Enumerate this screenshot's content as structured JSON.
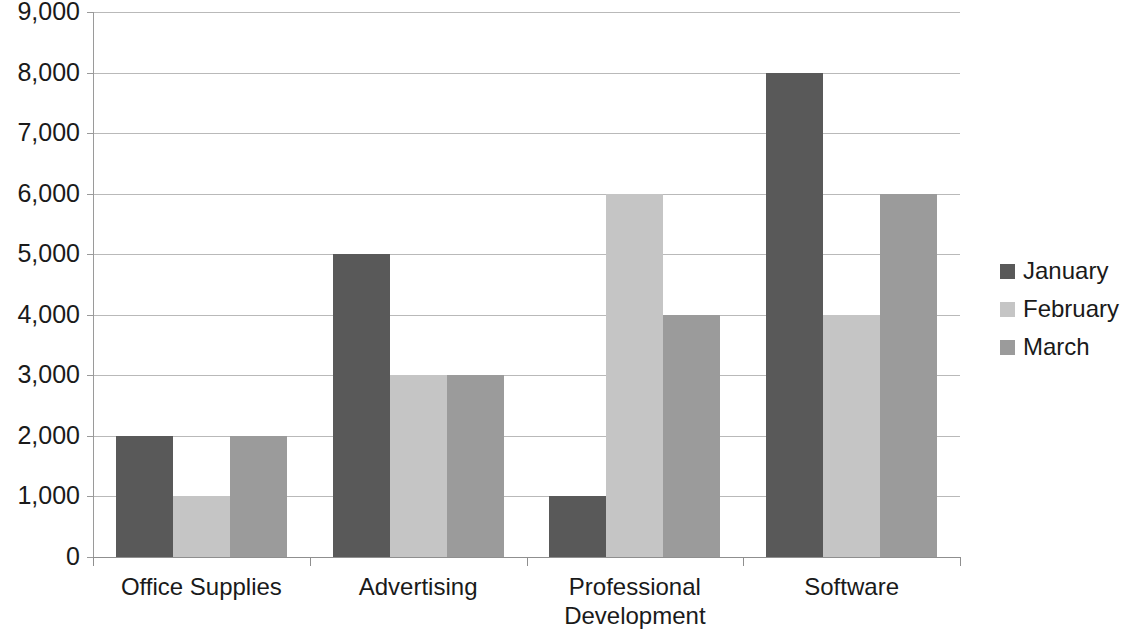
{
  "chart_data": {
    "type": "bar",
    "title": "",
    "subtitle": "",
    "xlabel": "",
    "ylabel": "",
    "categories": [
      "Office Supplies",
      "Advertising",
      "Professional Development",
      "Software"
    ],
    "category_lines": [
      [
        "Office Supplies"
      ],
      [
        "Advertising"
      ],
      [
        "Professional",
        "Development"
      ],
      [
        "Software"
      ]
    ],
    "series": [
      {
        "name": "January",
        "values": [
          2000,
          5000,
          1000,
          8000
        ],
        "color": "#595959"
      },
      {
        "name": "February",
        "values": [
          1000,
          3000,
          6000,
          4000
        ],
        "color": "#c5c5c5"
      },
      {
        "name": "March",
        "values": [
          2000,
          3000,
          4000,
          6000
        ],
        "color": "#9b9b9b"
      }
    ],
    "ylim": [
      0,
      9000
    ],
    "ytick_step": 1000,
    "ytick_labels": [
      "9,000",
      "8,000",
      "7,000",
      "6,000",
      "5,000",
      "4,000",
      "3,000",
      "2,000",
      "1,000",
      "0"
    ],
    "ytick_values": [
      9000,
      8000,
      7000,
      6000,
      5000,
      4000,
      3000,
      2000,
      1000,
      0
    ],
    "grid": true,
    "grid_axis": "y",
    "legend_position": "right",
    "background_color": "#ffffff",
    "gridline_color": "#b9b9b9",
    "axis_color": "#8f8f8f"
  },
  "legend": {
    "entries": [
      {
        "label": "January"
      },
      {
        "label": "February"
      },
      {
        "label": "March"
      }
    ]
  }
}
